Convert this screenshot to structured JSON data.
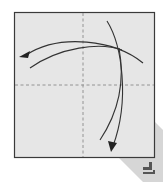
{
  "diagram": {
    "type": "origami-fold-instruction",
    "paper": {
      "x": 14,
      "y": 12,
      "width": 140,
      "height": 145,
      "fill": "#e6e6e6",
      "stroke": "#3a3a3a"
    },
    "crease_lines": [
      {
        "orientation": "vertical",
        "style": "valley-dashed",
        "x": 83
      },
      {
        "orientation": "horizontal",
        "style": "valley-dashed",
        "y": 85
      }
    ],
    "arrows": [
      {
        "name": "fold-right-edge-left",
        "direction": "left",
        "description": "curved arrow from right edge sweeping to the left edge"
      },
      {
        "name": "fold-top-edge-down",
        "direction": "down",
        "description": "curved arrow from top edge sweeping down to the bottom edge"
      }
    ],
    "shadow_band": {
      "color": "#d4d4d4",
      "from": "bottom-right corner",
      "direction": "diagonal down-right"
    },
    "symbols": [
      {
        "name": "turn-over-symbol",
        "position": "bottom-right",
        "color": "#555555"
      }
    ],
    "colors": {
      "line": "#333333",
      "crease": "#8a8a8a",
      "paper": "#e6e6e6",
      "background": "#ffffff"
    }
  }
}
